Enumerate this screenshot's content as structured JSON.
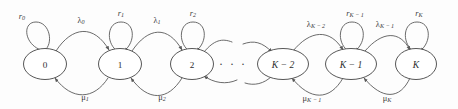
{
  "diagram": {
    "kind": "markov-chain-state-transition-diagram",
    "width": 458,
    "height": 109,
    "background_color": "#fdfdfd",
    "stroke_color": "#5a5a5a",
    "node_fill_color": "#ffffff",
    "node_stroke_color": "#4e4e4e",
    "text_color": "#2e2e2e",
    "ellipsis": "· · ·",
    "nodes": [
      {
        "id": "s0",
        "label": "0",
        "style": "numeric",
        "cx": 45,
        "cy": 64,
        "rx": 21.5,
        "ry": 15.5
      },
      {
        "id": "s1",
        "label": "1",
        "style": "numeric",
        "cx": 120,
        "cy": 64,
        "rx": 21.5,
        "ry": 15.5
      },
      {
        "id": "s2",
        "label": "2",
        "style": "numeric",
        "cx": 192,
        "cy": 64,
        "rx": 21.5,
        "ry": 15.5
      },
      {
        "id": "sKm2",
        "label": "K − 2",
        "style": "italic",
        "cx": 283,
        "cy": 64,
        "rx": 25.5,
        "ry": 15.5
      },
      {
        "id": "sKm1",
        "label": "K − 1",
        "style": "italic",
        "cx": 351,
        "cy": 64,
        "rx": 25.5,
        "ry": 15.5
      },
      {
        "id": "sK",
        "label": "K",
        "style": "italic",
        "cx": 416,
        "cy": 64,
        "rx": 20.5,
        "ry": 15.5
      }
    ],
    "self_loops": [
      {
        "id": "r0",
        "node": "s0",
        "base": "r",
        "sub": "0",
        "label_x": 22,
        "label_y": 16,
        "loop_cx": 42,
        "loop_cy": 36
      },
      {
        "id": "r1",
        "node": "s1",
        "base": "r",
        "sub": "1",
        "label_x": 121,
        "label_y": 13,
        "loop_cx": 121,
        "loop_cy": 34
      },
      {
        "id": "r2",
        "node": "s2",
        "base": "r",
        "sub": "2",
        "label_x": 193,
        "label_y": 13,
        "loop_cx": 193,
        "loop_cy": 34
      },
      {
        "id": "rKm1",
        "node": "sKm1",
        "base": "r",
        "sub": "K − 1",
        "label_x": 353,
        "label_y": 13,
        "loop_cx": 352,
        "loop_cy": 34
      },
      {
        "id": "rK",
        "node": "sK",
        "base": "r",
        "sub": "K",
        "label_x": 419,
        "label_y": 13,
        "loop_cx": 417,
        "loop_cy": 34
      }
    ],
    "forward_edges": [
      {
        "id": "lambda0",
        "from": "s0",
        "to": "s1",
        "base": "λ",
        "sub": "0",
        "label_x": 81,
        "label_y": 20
      },
      {
        "id": "lambda1",
        "from": "s1",
        "to": "s2",
        "base": "λ",
        "sub": "1",
        "label_x": 157,
        "label_y": 20
      },
      {
        "id": "lambdaKm2",
        "from": "sKm2",
        "to": "sKm1",
        "base": "λ",
        "sub": "K − 2",
        "label_x": 316,
        "label_y": 24
      },
      {
        "id": "lambdaKm1",
        "from": "sKm1",
        "to": "sK",
        "base": "λ",
        "sub": "K − 1",
        "label_x": 385,
        "label_y": 24
      }
    ],
    "backward_edges": [
      {
        "id": "mu1",
        "from": "s1",
        "to": "s0",
        "base": "μ",
        "sub": "1",
        "label_x": 85,
        "label_y": 97
      },
      {
        "id": "mu2",
        "from": "s2",
        "to": "s1",
        "base": "μ",
        "sub": "2",
        "label_x": 162,
        "label_y": 97
      },
      {
        "id": "muKm1",
        "from": "sKm1",
        "to": "sKm2",
        "base": "μ",
        "sub": "K − 1",
        "label_x": 312,
        "label_y": 98
      },
      {
        "id": "muK",
        "from": "sK",
        "to": "sKm1",
        "base": "μ",
        "sub": "K",
        "label_x": 387,
        "label_y": 98
      }
    ],
    "dangling_edges": [
      {
        "id": "lambda-in-from-left",
        "label": "",
        "kind": "forward-into-Km2"
      },
      {
        "id": "mu-out-to-left",
        "label": "",
        "kind": "backward-out-of-Km2"
      },
      {
        "id": "lambda-out-to-right",
        "label": "",
        "kind": "forward-out-of-2"
      },
      {
        "id": "mu-in-from-right",
        "label": "",
        "kind": "backward-into-2"
      }
    ],
    "ellipsis_marks": [
      {
        "id": "dots-left",
        "x": 224,
        "y": 64,
        "text": "· · ·"
      }
    ]
  }
}
